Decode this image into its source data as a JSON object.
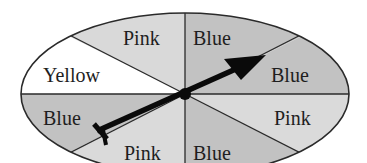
{
  "diagram": {
    "type": "spinner",
    "colors": {
      "pink_sector": "#d9d9d9",
      "blue_sector": "#c2c2c2",
      "yellow_sector": "#ffffff",
      "outline": "#2a2a2a",
      "arrow": "#0a0a0a"
    },
    "sectors": [
      {
        "position": "top-left",
        "label": "Pink"
      },
      {
        "position": "top-right",
        "label": "Blue"
      },
      {
        "position": "right-upper",
        "label": "Blue"
      },
      {
        "position": "right-lower",
        "label": "Pink"
      },
      {
        "position": "bottom-right",
        "label": "Blue"
      },
      {
        "position": "bottom-left",
        "label": "Pink"
      },
      {
        "position": "left-lower",
        "label": "Blue"
      },
      {
        "position": "left-upper",
        "label": "Yellow"
      }
    ],
    "arrow": {
      "points_to": "Blue (right-upper)"
    }
  }
}
